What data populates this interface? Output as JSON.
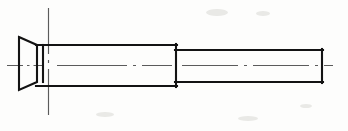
{
  "drawing": {
    "title": "Countersunk head bolt - side elevation",
    "part_name": "countersunk-head-bolt",
    "projection": "side elevation / longitudinal view",
    "background_color": "#fdfdfc",
    "outline_color": "#131313",
    "centerline_color": "#5b5b5b",
    "canvas": {
      "width": 348,
      "height": 131
    },
    "line_styles": {
      "outline_width": 2.1,
      "centerline_width": 1.15,
      "centerline_dash_pattern": "dash-dot (long dash, gap, dot, gap)"
    },
    "axis": {
      "horizontal_centerline": {
        "name": "horizontal-axis-centerline",
        "y": 65.5,
        "x_start": 7,
        "x_end": 333,
        "dash_array": "26 5 3 5",
        "segments_note": "broken where it crosses the head and the step"
      },
      "vertical_centerline": {
        "name": "vertical-head-centerline",
        "x": 48.5,
        "y_start": 8,
        "y_end": 121,
        "dash_array": "30 5 3 5"
      }
    },
    "features": [
      {
        "id": "head",
        "name": "countersunk-head",
        "type": "trapezoid",
        "description": "Flared conical countersunk head, large diameter at the left face, tapering down to the shank diameter on the right.",
        "left_face_x": 19,
        "right_face_x": 37,
        "left_top_y": 37,
        "left_bottom_y": 90,
        "right_top_y": 45,
        "right_bottom_y": 82,
        "head_diameter_px": 53,
        "head_length_px": 18
      },
      {
        "id": "collar",
        "name": "head-to-shank-collar",
        "type": "vertical-edge",
        "description": "Short cylindrical collar between the countersink taper and the large shank.",
        "x_start": 37,
        "x_end": 43,
        "top_y": 45,
        "bottom_y": 82
      },
      {
        "id": "shank-large",
        "name": "large-diameter-shank",
        "type": "rectangle",
        "description": "Main large-diameter cylindrical body of the bolt.",
        "x_start": 37,
        "x_end": 176,
        "top_y": 45,
        "bottom_y": 86,
        "diameter_px": 41,
        "length_px": 139
      },
      {
        "id": "step",
        "name": "diameter-step-shoulder",
        "type": "vertical-shoulder",
        "description": "Square shoulder where the large shank steps down to the reduced diameter.",
        "x": 176,
        "top_y": 45,
        "bottom_y": 86
      },
      {
        "id": "shank-small",
        "name": "reduced-diameter-shank",
        "type": "rectangle",
        "description": "Reduced-diameter cylindrical section running to the flat end of the bolt.",
        "x_start": 176,
        "x_end": 322,
        "top_y": 50,
        "bottom_y": 82,
        "diameter_px": 32,
        "length_px": 146
      },
      {
        "id": "end-face",
        "name": "right-end-face",
        "type": "vertical-edge",
        "description": "Flat end face at the right extremity of the bolt.",
        "x": 322,
        "top_y": 50,
        "bottom_y": 82
      }
    ],
    "centerline_segments": [
      {
        "name": "axis-seg-left-of-head",
        "x1": 7,
        "y1": 65.5,
        "x2": 44,
        "y2": 65.5
      },
      {
        "name": "axis-seg-large-shank",
        "x1": 58,
        "y1": 65.5,
        "x2": 172,
        "y2": 65.5
      },
      {
        "name": "axis-seg-small-shank",
        "x1": 182,
        "y1": 65.5,
        "x2": 333,
        "y2": 65.5
      }
    ],
    "labels": [],
    "dimensions": []
  }
}
